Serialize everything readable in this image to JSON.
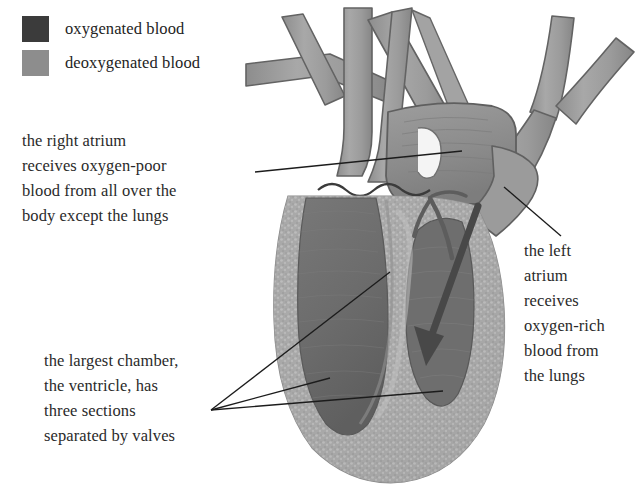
{
  "diagram": {
    "background_color": "#ffffff"
  },
  "legend": {
    "items": [
      {
        "label": "oxygenated blood",
        "color": "#3b3b3b",
        "icon": "color-swatch"
      },
      {
        "label": "deoxygenated blood",
        "color": "#8d8d8d",
        "icon": "color-swatch"
      }
    ]
  },
  "annotations": [
    {
      "id": "right-atrium",
      "lines": [
        "the right atrium",
        "receives oxygen-poor",
        "blood from all over the",
        "body except the lungs"
      ],
      "leader": {
        "type": "line",
        "from": [
          255,
          172
        ],
        "to": [
          462,
          151
        ]
      }
    },
    {
      "id": "left-atrium",
      "lines": [
        "the left",
        "atrium",
        "receives",
        "oxygen-rich",
        "blood from",
        "the lungs"
      ],
      "leader": {
        "type": "line",
        "from": [
          561,
          236
        ],
        "to": [
          504,
          187
        ]
      }
    },
    {
      "id": "ventricle",
      "lines": [
        "the largest chamber,",
        "the ventricle, has",
        "three sections",
        "separated by valves"
      ],
      "leader": {
        "type": "multi-arrow",
        "origin": [
          211,
          410
        ],
        "targets": [
          [
            390,
            272
          ],
          [
            330,
            378
          ],
          [
            443,
            391
          ]
        ]
      }
    }
  ],
  "illustration": {
    "colors": {
      "vessel_fill": "#9a9a9a",
      "vessel_fill_light": "#b0b0b0",
      "vessel_outline": "#5e5e5e",
      "myocardium": "#a8a8a8",
      "myocardium_speckle": "#bdbdbd",
      "chamber_dark": "#6f6f6f",
      "chamber_darker": "#636363",
      "atrium_fill": "#8e8e8e",
      "coronary_vessel": "#5a5a5a",
      "flow_arrow": "#4a4a4a",
      "leader_line": "#1d1d1d",
      "outline": "#6a6a6a"
    },
    "parts": [
      {
        "name": "superior-vena-cava",
        "kind": "vessel"
      },
      {
        "name": "pulmonary-artery-branch",
        "kind": "vessel"
      },
      {
        "name": "pulmonary-vein-branch",
        "kind": "vessel"
      },
      {
        "name": "aortic-arch",
        "kind": "vessel"
      },
      {
        "name": "right-atrium",
        "kind": "chamber"
      },
      {
        "name": "left-atrium",
        "kind": "chamber"
      },
      {
        "name": "ventricle-wall",
        "kind": "muscle"
      },
      {
        "name": "left-ventricle-cavity",
        "kind": "chamber"
      },
      {
        "name": "right-ventricle-cavity",
        "kind": "chamber"
      },
      {
        "name": "blood-flow-arrow",
        "kind": "arrow"
      },
      {
        "name": "coronary-vessels",
        "kind": "vessel"
      }
    ]
  }
}
